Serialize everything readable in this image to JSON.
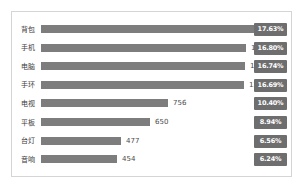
{
  "chart_data": {
    "type": "bar",
    "orientation": "horizontal",
    "title": "",
    "subtitle": "",
    "xlabel": "",
    "ylabel": "",
    "grid": false,
    "legend": "none",
    "xlim": [
      0,
      1282
    ],
    "categories": [
      "背包",
      "手机",
      "电脑",
      "手环",
      "电视",
      "平板",
      "台灯",
      "音响"
    ],
    "values": [
      1282,
      1221,
      1217,
      1213,
      756,
      650,
      477,
      454
    ],
    "value_labels": [
      "1282",
      "1221",
      "1217",
      "1213",
      "756",
      "650",
      "477",
      "454"
    ],
    "percent_labels": [
      "17.63%",
      "16.80%",
      "16.74%",
      "16.69%",
      "10.40%",
      "8.94%",
      "6.56%",
      "6.24%"
    ],
    "percents": [
      17.63,
      16.8,
      16.74,
      16.69,
      10.4,
      8.94,
      6.56,
      6.24
    ],
    "series": [
      {
        "name": "数量",
        "values": [
          1282,
          1221,
          1217,
          1213,
          756,
          650,
          477,
          454
        ]
      },
      {
        "name": "占比",
        "values": [
          17.63,
          16.8,
          16.74,
          16.69,
          10.4,
          8.94,
          6.56,
          6.24
        ]
      }
    ]
  },
  "style": {
    "bar_color": "#7d7d7d",
    "badge_bg": "#6e6e6e",
    "badge_text": "#ffffff",
    "frame_border": "#d5d5d5",
    "label_color": "#3d3d3d",
    "value_color": "#4a4a4a",
    "background": "#ffffff"
  }
}
